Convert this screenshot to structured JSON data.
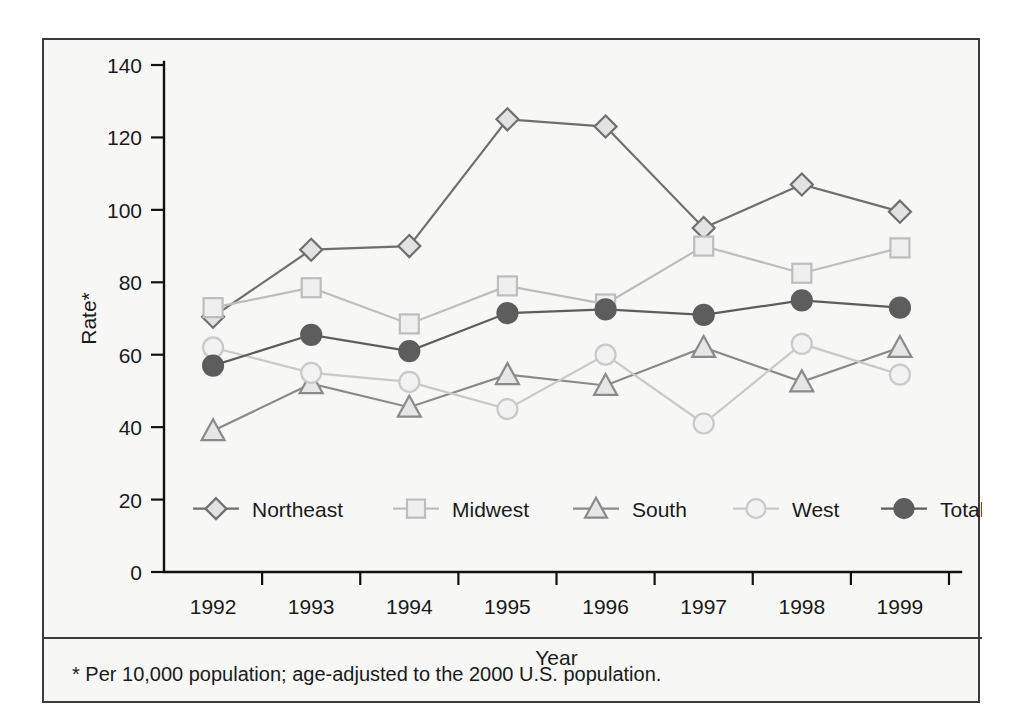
{
  "figure": {
    "footnote": "* Per 10,000 population; age-adjusted to the 2000 U.S. population.",
    "frame_color": "#3b3b3b",
    "background_color": "#f7f7f5"
  },
  "chart_data": {
    "type": "line",
    "title": "",
    "xlabel": "Year",
    "ylabel": "Rate*",
    "categories": [
      "1992",
      "1993",
      "1994",
      "1995",
      "1996",
      "1997",
      "1998",
      "1999"
    ],
    "x": [
      1992,
      1993,
      1994,
      1995,
      1996,
      1997,
      1998,
      1999
    ],
    "ylim": [
      0,
      140
    ],
    "yticks": [
      0,
      20,
      40,
      60,
      80,
      100,
      120,
      140
    ],
    "ytick_labels": [
      "0",
      "20",
      "40",
      "60",
      "80",
      "100",
      "120",
      "140"
    ],
    "grid": false,
    "legend_position": "inside-bottom",
    "series": [
      {
        "name": "Northeast",
        "marker": "diamond",
        "color": "#6f6f6f",
        "fill": "#e2e2e2",
        "values": [
          70.5,
          89.0,
          90.0,
          125.0,
          123.0,
          95.0,
          107.0,
          99.5
        ]
      },
      {
        "name": "Midwest",
        "marker": "square",
        "color": "#bdbdbd",
        "fill": "#efefef",
        "values": [
          73.0,
          78.5,
          68.5,
          79.0,
          74.0,
          90.0,
          82.5,
          89.5
        ]
      },
      {
        "name": "South",
        "marker": "triangle",
        "color": "#8a8a8a",
        "fill": "#e6e6e6",
        "values": [
          39.0,
          52.0,
          45.5,
          54.5,
          51.5,
          62.0,
          52.5,
          62.0
        ]
      },
      {
        "name": "West",
        "marker": "circle",
        "color": "#c9c9c9",
        "fill": "#f2f2f2",
        "values": [
          62.0,
          55.0,
          52.5,
          45.0,
          60.0,
          41.0,
          63.0,
          54.5
        ]
      },
      {
        "name": "Total",
        "marker": "circle-filled",
        "color": "#5d5d5d",
        "fill": "#5d5d5d",
        "values": [
          57.0,
          65.5,
          61.0,
          71.5,
          72.5,
          71.0,
          75.0,
          73.0
        ]
      }
    ]
  }
}
